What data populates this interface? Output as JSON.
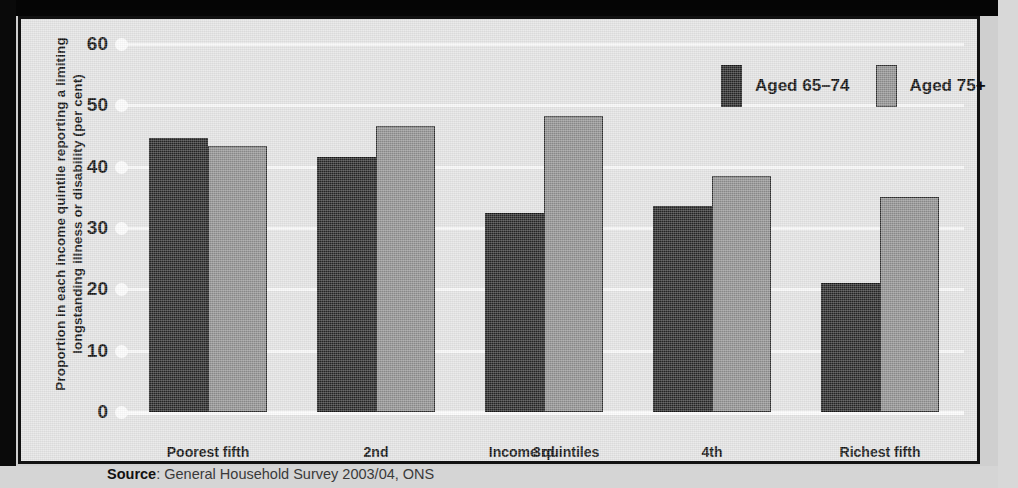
{
  "chart_data": {
    "type": "bar",
    "title": "",
    "xlabel": "Income quintiles",
    "ylabel": "Proportion in each income quintile reporting a limiting longstanding illness or disability (per cent)",
    "categories": [
      "Poorest fifth",
      "2nd",
      "3rd",
      "4th",
      "Richest fifth"
    ],
    "series": [
      {
        "name": "Aged 65–74",
        "color": "#262626",
        "values": [
          44.6,
          41.6,
          32.4,
          33.6,
          21.0
        ]
      },
      {
        "name": "Aged 75+",
        "color": "#8e8e8e",
        "values": [
          43.4,
          46.6,
          48.3,
          38.4,
          35.1
        ]
      }
    ],
    "ylim": [
      0,
      60
    ],
    "ytick_values": [
      60,
      50,
      40,
      30,
      20,
      10,
      0
    ],
    "ytick_labels": [
      "60",
      "50",
      "40",
      "30",
      "20",
      "10",
      "0"
    ],
    "grid": true,
    "legend_position": "top-right",
    "source_label": "Source",
    "source_text": ": General Household Survey 2003/04, ONS"
  },
  "colors": {
    "panel_background": "#e2e2e2",
    "panel_border": "#111111",
    "gridline": "#f7f7f7",
    "series_dark": "#262626",
    "series_light": "#8e8e8e",
    "text": "#0d0d0d"
  }
}
